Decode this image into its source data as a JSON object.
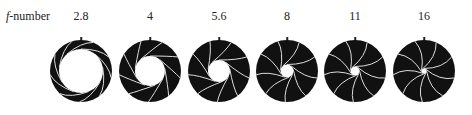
{
  "row_label": {
    "italic": "f",
    "rest": "-number"
  },
  "apertures": [
    {
      "label": "2.8",
      "cx": 81,
      "hole": 22
    },
    {
      "label": "4",
      "cx": 150,
      "hole": 15
    },
    {
      "label": "5.6",
      "cx": 219,
      "hole": 11
    },
    {
      "label": "8",
      "cx": 287,
      "hole": 6.5
    },
    {
      "label": "11",
      "cx": 355,
      "hole": 4.5
    },
    {
      "label": "16",
      "cx": 424,
      "hole": 2.5
    }
  ],
  "outer_radius": 31,
  "blades": 9,
  "colors": {
    "blade": "#111111",
    "edge": "#dddddd"
  }
}
